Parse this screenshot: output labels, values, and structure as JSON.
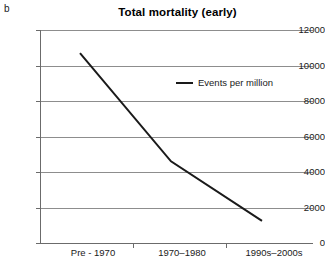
{
  "panel": {
    "label": "b"
  },
  "chart_data": {
    "type": "line",
    "title": "Total mortality (early)",
    "xlabel": "",
    "ylabel": "",
    "categories": [
      "Pre - 1970",
      "1970–1980",
      "1990s–2000s"
    ],
    "series": [
      {
        "name": "Events per million",
        "values": [
          10700,
          4600,
          1250
        ],
        "color": "#1a1a1a"
      }
    ],
    "ylim": [
      0,
      12000
    ],
    "yticks": [
      0,
      2000,
      4000,
      6000,
      8000,
      10000,
      12000
    ],
    "ytick_labels": [
      "0",
      "2000",
      "4000",
      "6000",
      "8000",
      "10000",
      "12000"
    ],
    "grid": true,
    "grid_axis": "y",
    "legend": {
      "position": "upper-right-inside",
      "entries": [
        "Events per million"
      ]
    }
  },
  "legend": {
    "marker_name": "line-marker",
    "label": "Events per million"
  },
  "colors": {
    "line": "#1a1a1a",
    "grid": "#8d8d8d",
    "axis": "#6b6b6b",
    "background": "#ffffff"
  }
}
